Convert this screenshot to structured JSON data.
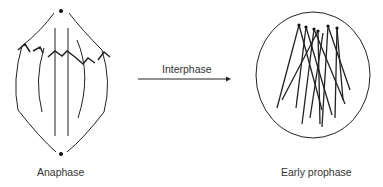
{
  "diagram": {
    "left": {
      "label": "Anaphase"
    },
    "arrow": {
      "label": "Interphase"
    },
    "right": {
      "label": "Early prophase"
    }
  }
}
